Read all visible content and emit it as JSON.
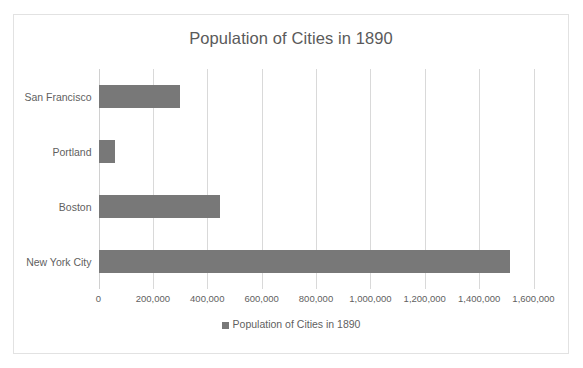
{
  "chart_data": {
    "type": "bar",
    "orientation": "horizontal",
    "title": "Population of Cities in 1890",
    "xlabel": "",
    "ylabel": "",
    "categories": [
      "San Francisco",
      "Portland",
      "Boston",
      "New York City"
    ],
    "values": [
      299000,
      62000,
      448000,
      1515000
    ],
    "series": [
      {
        "name": "Population of Cities in 1890",
        "values": [
          299000,
          62000,
          448000,
          1515000
        ]
      }
    ],
    "xlim": [
      0,
      1600000
    ],
    "xticks": [
      0,
      200000,
      400000,
      600000,
      800000,
      1000000,
      1200000,
      1400000,
      1600000
    ],
    "xtick_labels": [
      "0",
      "200,000",
      "400,000",
      "600,000",
      "800,000",
      "1,000,000",
      "1,200,000",
      "1,400,000",
      "1,600,000"
    ],
    "grid": true,
    "grid_axis": "x",
    "legend": {
      "position": "bottom",
      "entries": [
        {
          "label": "Population of Cities in 1890",
          "marker": "square",
          "color": "#787878"
        }
      ]
    },
    "colors": {
      "bar": "#787878",
      "gridline": "#d9d9d9",
      "border": "#e2e2e2",
      "text": "#5f5f5f",
      "title": "#5a5a5a",
      "background": "#ffffff"
    }
  }
}
